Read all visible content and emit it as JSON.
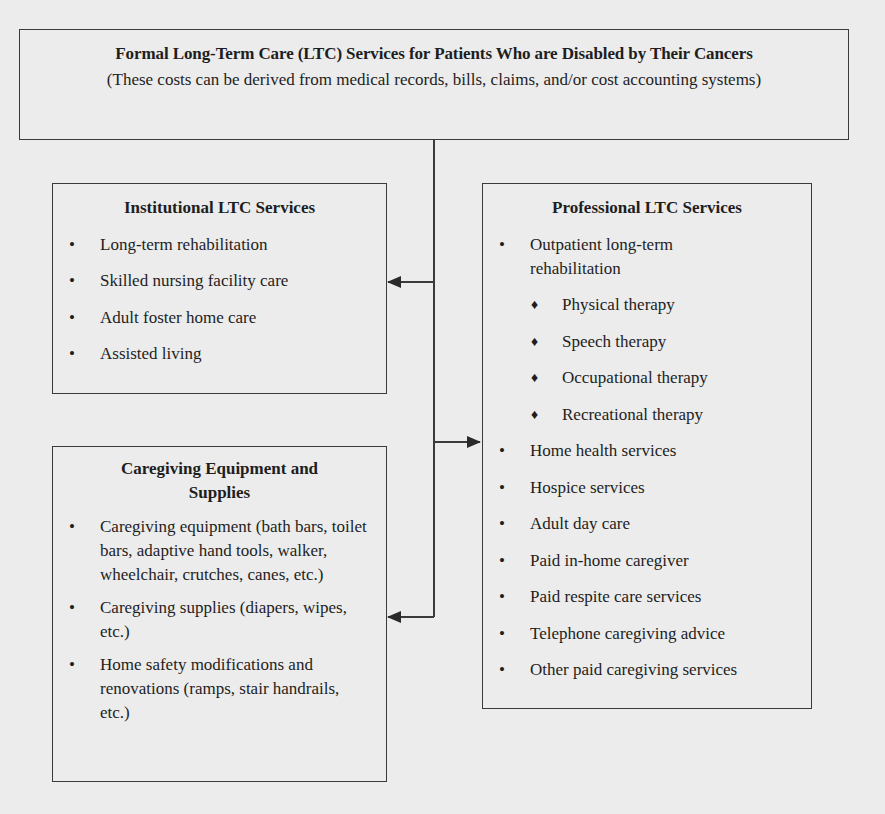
{
  "top": {
    "title": "Formal Long-Term Care (LTC) Services for Patients Who are Disabled by Their Cancers",
    "subtitle": "(These costs can be derived from medical records, bills, claims, and/or cost accounting systems)"
  },
  "institutional": {
    "title": "Institutional LTC Services",
    "items": [
      "Long-term rehabilitation",
      "Skilled nursing facility care",
      "Adult foster home care",
      "Assisted living"
    ]
  },
  "caregiving": {
    "title": "Caregiving Equipment and Supplies",
    "items": [
      "Caregiving equipment (bath bars, toilet bars, adaptive hand tools, walker, wheelchair, crutches, canes, etc.)",
      "Caregiving supplies (diapers, wipes, etc.)",
      "Home safety modifications and renovations (ramps, stair handrails, etc.)"
    ]
  },
  "professional": {
    "title": "Professional LTC Services",
    "items": [
      "Outpatient long-term rehabilitation",
      "Home health services",
      "Hospice services",
      "Adult day care",
      "Paid in-home caregiver",
      "Paid respite care services",
      "Telephone caregiving advice",
      "Other paid caregiving services"
    ],
    "sub_items": [
      "Physical therapy",
      "Speech therapy",
      "Occupational therapy",
      "Recreational therapy"
    ]
  },
  "icons": {
    "bullet": "•",
    "diamond": "♦"
  },
  "colors": {
    "line": "#3a3a3a",
    "background": "#ececec"
  }
}
